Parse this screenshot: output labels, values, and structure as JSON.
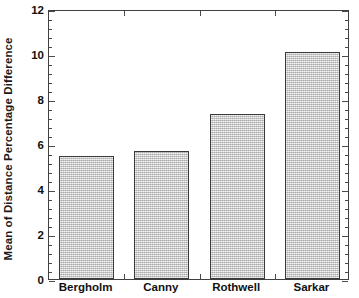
{
  "chart_data": {
    "type": "bar",
    "title": "",
    "subtitle": "",
    "xlabel": "",
    "ylabel": "Mean of Distance Percentage Difference",
    "categories": [
      "Bergholm",
      "Canny",
      "Rothwell",
      "Sarkar"
    ],
    "values": [
      5.45,
      5.7,
      7.35,
      10.1
    ],
    "ylim": [
      0,
      12
    ],
    "y_major_ticks": [
      0,
      2,
      4,
      6,
      8,
      10,
      12
    ],
    "y_tick_labels": [
      "0",
      "2",
      "4",
      "6",
      "8",
      "10",
      "12"
    ],
    "y_minor_tick_step": 0.4,
    "grid": false,
    "legend": null,
    "bar_fill_color": "#c9c9c9",
    "bar_edge_color": "#3a3a3a",
    "axis_color": "#404040",
    "text_color": "#111111",
    "background_color": "#ffffff"
  }
}
